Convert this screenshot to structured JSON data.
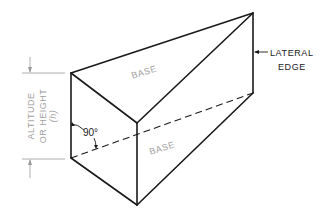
{
  "figure": {
    "labels": {
      "base_top": "BASE",
      "base_bottom": "BASE",
      "lateral_edge_line1": "LATERAL",
      "lateral_edge_line2": "EDGE",
      "altitude_line1": "ALTITUDE",
      "altitude_line2": "OR HEIGHT",
      "altitude_symbol": "(h)",
      "angle": "90°"
    },
    "colors": {
      "edges": "#1a1a1a",
      "dimension_lines": "#9a9a9a",
      "label_text": "#a0a0a0",
      "background": "#ffffff"
    }
  }
}
